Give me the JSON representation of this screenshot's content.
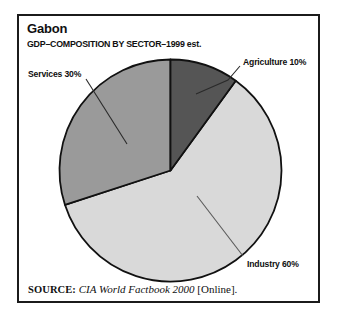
{
  "figure": {
    "title": "Gabon",
    "subtitle": "GDP–COMPOSITION BY SECTOR–1999 est.",
    "frame_color": "#1b1b1b",
    "background": "#ffffff"
  },
  "source": {
    "label": "SOURCE:",
    "title": "CIA World Factbook 2000",
    "suffix": "[Online]."
  },
  "labels": {
    "agriculture": "Agriculture 10%",
    "services": "Services 30%",
    "industry": "Industry 60%"
  },
  "chart_data": {
    "type": "pie",
    "title": "Gabon",
    "subtitle": "GDP–COMPOSITION BY SECTOR–1999 est.",
    "xlabel": "",
    "ylabel": "",
    "categories": [
      "Agriculture",
      "Industry",
      "Services"
    ],
    "values": [
      10,
      60,
      30
    ],
    "units": "percent",
    "total": 100,
    "slice_colors": [
      "#555555",
      "#d9d9d9",
      "#9a9a9a"
    ],
    "slice_labels": [
      "Agriculture 10%",
      "Industry 60%",
      "Services 30%"
    ],
    "start_angle_deg": 0,
    "direction": "clockwise",
    "legend": "none",
    "annotations": [
      "Agriculture 10%",
      "Industry 60%",
      "Services 30%"
    ],
    "grid": false,
    "source": "SOURCE: CIA World Factbook 2000 [Online]."
  }
}
